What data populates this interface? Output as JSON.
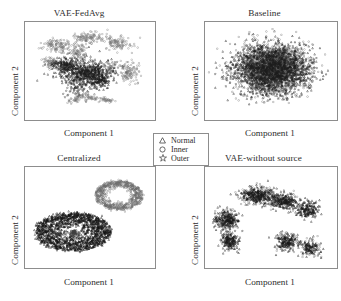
{
  "figure": {
    "caption_absent": true,
    "background_color": "#ffffff",
    "border_color": "#8d8d8d"
  },
  "axis_labels": {
    "x": "Component 1",
    "y": "Component 2"
  },
  "legend": {
    "entries": [
      {
        "marker": "triangle-marker-icon",
        "glyph": "△",
        "label": "Normal"
      },
      {
        "marker": "circle-marker-icon",
        "glyph": "○",
        "label": "Inner"
      },
      {
        "marker": "star-marker-icon",
        "glyph": "☆",
        "label": "Outer"
      }
    ]
  },
  "panels": [
    {
      "id": "vae-fedavg",
      "title": "VAE-FedAvg",
      "xlabel": "Component 1",
      "ylabel": "Component 2"
    },
    {
      "id": "baseline",
      "title": "Baseline",
      "xlabel": "Component 1",
      "ylabel": "Component 2"
    },
    {
      "id": "centralized",
      "title": "Centralized",
      "xlabel": "Component 1",
      "ylabel": "Component 2"
    },
    {
      "id": "vae-without-source",
      "title": "VAE-without source",
      "xlabel": "Component 1",
      "ylabel": "Component 2"
    }
  ],
  "chart_data": [
    {
      "type": "scatter",
      "panel": "vae-fedavg",
      "title": "VAE-FedAvg",
      "xlabel": "Component 1",
      "ylabel": "Component 2",
      "xlim": [
        0,
        100
      ],
      "ylim": [
        0,
        100
      ],
      "grid": false,
      "ticks": false,
      "legend_position": "figure-center",
      "description": "Central dense dark cluster surrounded by several gray lobes; classes partially separated.",
      "series": [
        {
          "name": "Normal",
          "marker": "triangle",
          "color": "#1c1c1c",
          "n_points": 900,
          "clusters": [
            {
              "cx": 46,
              "cy": 48,
              "rx": 20,
              "ry": 15,
              "weight": 0.72,
              "shape": "blob"
            },
            {
              "cx": 30,
              "cy": 56,
              "rx": 9,
              "ry": 8,
              "weight": 0.16,
              "shape": "blob"
            },
            {
              "cx": 58,
              "cy": 40,
              "rx": 8,
              "ry": 8,
              "weight": 0.12,
              "shape": "blob"
            }
          ]
        },
        {
          "name": "Inner",
          "marker": "circle",
          "color": "#7a7a7a",
          "n_points": 760,
          "clusters": [
            {
              "cx": 25,
              "cy": 76,
              "rx": 12,
              "ry": 7,
              "weight": 0.17,
              "shape": "blob"
            },
            {
              "cx": 49,
              "cy": 84,
              "rx": 13,
              "ry": 6,
              "weight": 0.16,
              "shape": "blob"
            },
            {
              "cx": 72,
              "cy": 78,
              "rx": 11,
              "ry": 7,
              "weight": 0.15,
              "shape": "blob"
            },
            {
              "cx": 41,
              "cy": 69,
              "rx": 7,
              "ry": 9,
              "weight": 0.12,
              "shape": "blob"
            },
            {
              "cx": 20,
              "cy": 58,
              "rx": 7,
              "ry": 7,
              "weight": 0.1,
              "shape": "blob"
            },
            {
              "cx": 80,
              "cy": 48,
              "rx": 9,
              "ry": 12,
              "weight": 0.16,
              "shape": "blob"
            },
            {
              "cx": 50,
              "cy": 16,
              "rx": 20,
              "ry": 7,
              "weight": 0.14,
              "shape": "arc"
            }
          ]
        },
        {
          "name": "Outer",
          "marker": "star",
          "color": "#5a5a5a",
          "n_points": 120,
          "clusters": [
            {
              "cx": 64,
              "cy": 52,
              "rx": 10,
              "ry": 10,
              "weight": 0.5,
              "shape": "blob"
            },
            {
              "cx": 40,
              "cy": 30,
              "rx": 12,
              "ry": 10,
              "weight": 0.5,
              "shape": "blob"
            }
          ]
        }
      ]
    },
    {
      "type": "scatter",
      "panel": "baseline",
      "title": "Baseline",
      "xlabel": "Component 1",
      "ylabel": "Component 2",
      "xlim": [
        0,
        100
      ],
      "ylim": [
        0,
        100
      ],
      "grid": false,
      "ticks": false,
      "description": "One large fully-overlapping cloud; all three classes are entangled with no separation.",
      "series": [
        {
          "name": "Normal",
          "marker": "triangle",
          "color": "#1c1c1c",
          "n_points": 1500,
          "clusters": [
            {
              "cx": 50,
              "cy": 52,
              "rx": 30,
              "ry": 26,
              "weight": 1.0,
              "shape": "blob"
            }
          ]
        },
        {
          "name": "Inner",
          "marker": "circle",
          "color": "#6f6f6f",
          "n_points": 1400,
          "clusters": [
            {
              "cx": 50,
              "cy": 52,
              "rx": 30,
              "ry": 26,
              "weight": 1.0,
              "shape": "blob"
            }
          ]
        },
        {
          "name": "Outer",
          "marker": "star",
          "color": "#4a4a4a",
          "n_points": 700,
          "clusters": [
            {
              "cx": 50,
              "cy": 52,
              "rx": 29,
              "ry": 25,
              "weight": 1.0,
              "shape": "blob"
            }
          ]
        }
      ]
    },
    {
      "type": "scatter",
      "panel": "centralized",
      "title": "Centralized",
      "xlabel": "Component 1",
      "ylabel": "Component 2",
      "xlim": [
        0,
        100
      ],
      "ylim": [
        0,
        100
      ],
      "grid": false,
      "ticks": false,
      "description": "Two clearly separated ring-shaped clusters: a gray annulus at upper right and a larger black annulus at lower left.",
      "series": [
        {
          "name": "Normal",
          "marker": "triangle",
          "color": "#141414",
          "n_points": 1600,
          "clusters": [
            {
              "cx": 37,
              "cy": 36,
              "rx": 29,
              "ry": 19,
              "inner_rx": 6,
              "inner_ry": 4,
              "weight": 1.0,
              "shape": "ring"
            }
          ]
        },
        {
          "name": "Inner",
          "marker": "circle",
          "color": "#6b6b6b",
          "n_points": 700,
          "clusters": [
            {
              "cx": 72,
              "cy": 72,
              "rx": 18,
              "ry": 14,
              "inner_rx": 9,
              "inner_ry": 7,
              "weight": 1.0,
              "shape": "ring"
            }
          ]
        },
        {
          "name": "Outer",
          "marker": "star",
          "color": "#3d3d3d",
          "n_points": 60,
          "clusters": [
            {
              "cx": 38,
              "cy": 34,
              "rx": 5,
              "ry": 4,
              "weight": 1.0,
              "shape": "blob"
            }
          ]
        }
      ]
    },
    {
      "type": "scatter",
      "panel": "vae-without-source",
      "title": "VAE-without source",
      "xlabel": "Component 1",
      "ylabel": "Component 2",
      "xlim": [
        0,
        100
      ],
      "ylim": [
        0,
        100
      ],
      "grid": false,
      "ticks": false,
      "description": "Multiple separate dark blobs spread diagonally; classes fragment into many small groups.",
      "series": [
        {
          "name": "Normal",
          "marker": "triangle",
          "color": "#181818",
          "n_points": 1300,
          "clusters": [
            {
              "cx": 16,
              "cy": 48,
              "rx": 9,
              "ry": 10,
              "weight": 0.16,
              "shape": "blob"
            },
            {
              "cx": 19,
              "cy": 26,
              "rx": 8,
              "ry": 9,
              "weight": 0.14,
              "shape": "blob"
            },
            {
              "cx": 40,
              "cy": 72,
              "rx": 13,
              "ry": 9,
              "weight": 0.2,
              "shape": "blob"
            },
            {
              "cx": 60,
              "cy": 66,
              "rx": 11,
              "ry": 8,
              "weight": 0.16,
              "shape": "blob"
            },
            {
              "cx": 78,
              "cy": 58,
              "rx": 9,
              "ry": 9,
              "weight": 0.14,
              "shape": "blob"
            },
            {
              "cx": 62,
              "cy": 26,
              "rx": 9,
              "ry": 9,
              "weight": 0.12,
              "shape": "blob"
            },
            {
              "cx": 80,
              "cy": 20,
              "rx": 8,
              "ry": 8,
              "weight": 0.08,
              "shape": "blob"
            }
          ]
        },
        {
          "name": "Inner",
          "marker": "circle",
          "color": "#707070",
          "n_points": 420,
          "clusters": [
            {
              "cx": 16,
              "cy": 48,
              "rx": 9,
              "ry": 10,
              "weight": 0.2,
              "shape": "blob"
            },
            {
              "cx": 40,
              "cy": 72,
              "rx": 13,
              "ry": 9,
              "weight": 0.25,
              "shape": "blob"
            },
            {
              "cx": 60,
              "cy": 66,
              "rx": 11,
              "ry": 8,
              "weight": 0.2,
              "shape": "blob"
            },
            {
              "cx": 62,
              "cy": 26,
              "rx": 9,
              "ry": 9,
              "weight": 0.2,
              "shape": "blob"
            },
            {
              "cx": 80,
              "cy": 20,
              "rx": 8,
              "ry": 8,
              "weight": 0.15,
              "shape": "blob"
            }
          ]
        },
        {
          "name": "Outer",
          "marker": "star",
          "color": "#484848",
          "n_points": 90,
          "clusters": [
            {
              "cx": 45,
              "cy": 70,
              "rx": 14,
              "ry": 10,
              "weight": 0.6,
              "shape": "blob"
            },
            {
              "cx": 18,
              "cy": 40,
              "rx": 8,
              "ry": 10,
              "weight": 0.4,
              "shape": "blob"
            }
          ]
        }
      ]
    }
  ]
}
